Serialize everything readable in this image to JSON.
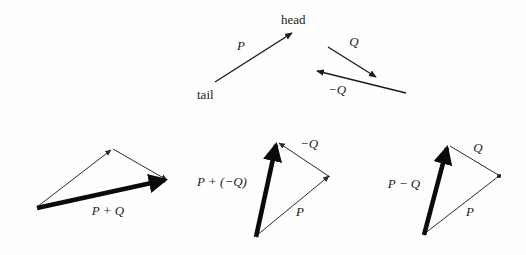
{
  "figure": {
    "background_color": "#fefefe",
    "ink_color": "#1b1b1b",
    "width": 526,
    "height": 255
  },
  "top_row": {
    "vector_p": {
      "label": "P",
      "tail_label": "tail",
      "head_label": "head"
    },
    "vector_q": {
      "label": "Q"
    },
    "vector_neg_q": {
      "label": "−Q"
    }
  },
  "panels": [
    {
      "id": "p-plus-q",
      "result_label": "P + Q",
      "side_labels": []
    },
    {
      "id": "p-plus-neg-q",
      "result_label": "P + (−Q)",
      "side_labels": [
        "−Q",
        "P"
      ]
    },
    {
      "id": "p-minus-q",
      "result_label": "P − Q",
      "side_labels": [
        "Q",
        "P"
      ]
    }
  ],
  "labels": {
    "head": "head",
    "tail": "tail",
    "P": "P",
    "Q": "Q",
    "negQ": "−Q",
    "p_plus_q": "P + Q",
    "p_plus_neg_q": "P + (−Q)",
    "p_minus_q": "P − Q",
    "P_mid": "P",
    "P_right": "P",
    "negQ_mid": "−Q",
    "Q_right": "Q"
  }
}
